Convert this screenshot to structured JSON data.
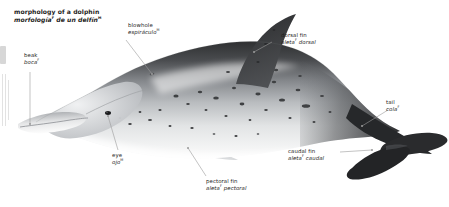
{
  "title": {
    "en": "morphology of a dolphin",
    "es_word": "morfología",
    "es_gender1": "F",
    "es_rest": " de un delfín",
    "es_gender2": "M"
  },
  "labels": [
    {
      "id": "beak",
      "en": "beak",
      "es": "boca",
      "es_suffix": "",
      "gender": "F"
    },
    {
      "id": "blowhole",
      "en": "blowhole",
      "es": "espiráculo",
      "es_suffix": "",
      "gender": "M"
    },
    {
      "id": "dorsal-fin",
      "en": "dorsal fin",
      "es": "aleta",
      "es_suffix": " dorsal",
      "gender": "F"
    },
    {
      "id": "tail",
      "en": "tail",
      "es": "cola",
      "es_suffix": "",
      "gender": "F"
    },
    {
      "id": "caudal-fin",
      "en": "caudal fin",
      "es": "aleta",
      "es_suffix": " caudal",
      "gender": "F"
    },
    {
      "id": "pectoral-fin",
      "en": "pectoral fin",
      "es": "aleta",
      "es_suffix": " pectoral",
      "gender": "F"
    },
    {
      "id": "eye",
      "en": "eye",
      "es": "ojo",
      "es_suffix": "",
      "gender": "M"
    }
  ],
  "colors": {
    "text": "#1d1d1b",
    "leader_line": "#9a9a9a",
    "dorsal_dark": "#3a3a3c",
    "body_mid": "#8d9094",
    "belly_light": "#f2f3f4",
    "background": "#ffffff"
  }
}
